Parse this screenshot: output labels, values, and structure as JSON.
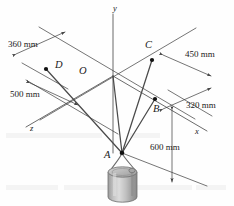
{
  "figure": {
    "colors": {
      "line": "#3a3a3a",
      "cable": "#4a4a4a",
      "point": "#111111",
      "text": "#1a1a1a",
      "cylinder_body": "#b9b9b9",
      "cylinder_highlight": "#d8d8d8",
      "cylinder_shade": "#8e8e8e",
      "cylinder_top": "#c9c9c9",
      "background": "#ffffff"
    },
    "axes": [
      {
        "name": "y-axis",
        "label": "y",
        "x": 113,
        "y": 4
      },
      {
        "name": "x-axis",
        "label": "x",
        "x": 195,
        "y": 127
      },
      {
        "name": "z-axis",
        "label": "z",
        "x": 30,
        "y": 124
      }
    ],
    "points": [
      {
        "name": "point-o",
        "label": "O",
        "lx": 79,
        "ly": 68,
        "cx": 113,
        "cy": 76,
        "dot": false
      },
      {
        "name": "point-a",
        "label": "A",
        "lx": 104,
        "ly": 148,
        "cx": 122,
        "cy": 153,
        "dot": true
      },
      {
        "name": "point-b",
        "label": "B",
        "lx": 154,
        "ly": 106,
        "cx": 155,
        "cy": 99,
        "dot": true
      },
      {
        "name": "point-c",
        "label": "C",
        "lx": 146,
        "ly": 42,
        "cx": 152,
        "cy": 60,
        "dot": true
      },
      {
        "name": "point-d",
        "label": "D",
        "lx": 55,
        "ly": 62,
        "cx": 46,
        "cy": 69,
        "dot": true
      }
    ],
    "dimensions": [
      {
        "name": "dimension-360mm",
        "label": "360 mm",
        "lx": 8,
        "ly": 42
      },
      {
        "name": "dimension-450mm",
        "label": "450 mm",
        "lx": 186,
        "ly": 55
      },
      {
        "name": "dimension-500mm",
        "label": "500 mm",
        "lx": 10,
        "ly": 92
      },
      {
        "name": "dimension-320mm",
        "label": "320 mm",
        "lx": 187,
        "ly": 104
      },
      {
        "name": "dimension-600mm",
        "label": "600 mm",
        "lx": 151,
        "ly": 146
      }
    ],
    "cables": [
      {
        "name": "cable-ab",
        "from": "A",
        "to": "B"
      },
      {
        "name": "cable-ac",
        "from": "A",
        "to": "C"
      },
      {
        "name": "cable-ad",
        "from": "A",
        "to": "D"
      },
      {
        "name": "cable-ay",
        "from": "A",
        "to": "O"
      }
    ],
    "load": {
      "name": "cylinder-weight",
      "shape": "cylinder"
    }
  }
}
